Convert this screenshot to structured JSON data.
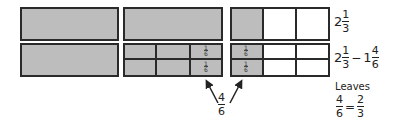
{
  "diagram": {
    "colors": {
      "shaded": "#bdbdbd",
      "border": "#2a2a2a",
      "empty": "#ffffff"
    },
    "top_row": {
      "wholes": 2,
      "partial_shaded_thirds": 1,
      "label": {
        "whole": "2",
        "numerator": "1",
        "denominator": "3"
      }
    },
    "bottom_row": {
      "sixth_cell_label": {
        "numerator": "1",
        "denominator": "6"
      },
      "label": {
        "a_whole": "2",
        "a_numerator": "1",
        "a_denominator": "3",
        "operator": "−",
        "b_whole": "1",
        "b_numerator": "4",
        "b_denominator": "6"
      }
    },
    "arrow_label": {
      "numerator": "4",
      "denominator": "6"
    },
    "result": {
      "caption": "Leaves",
      "lhs_numerator": "4",
      "lhs_denominator": "6",
      "equals": "=",
      "rhs_numerator": "2",
      "rhs_denominator": "3"
    }
  }
}
